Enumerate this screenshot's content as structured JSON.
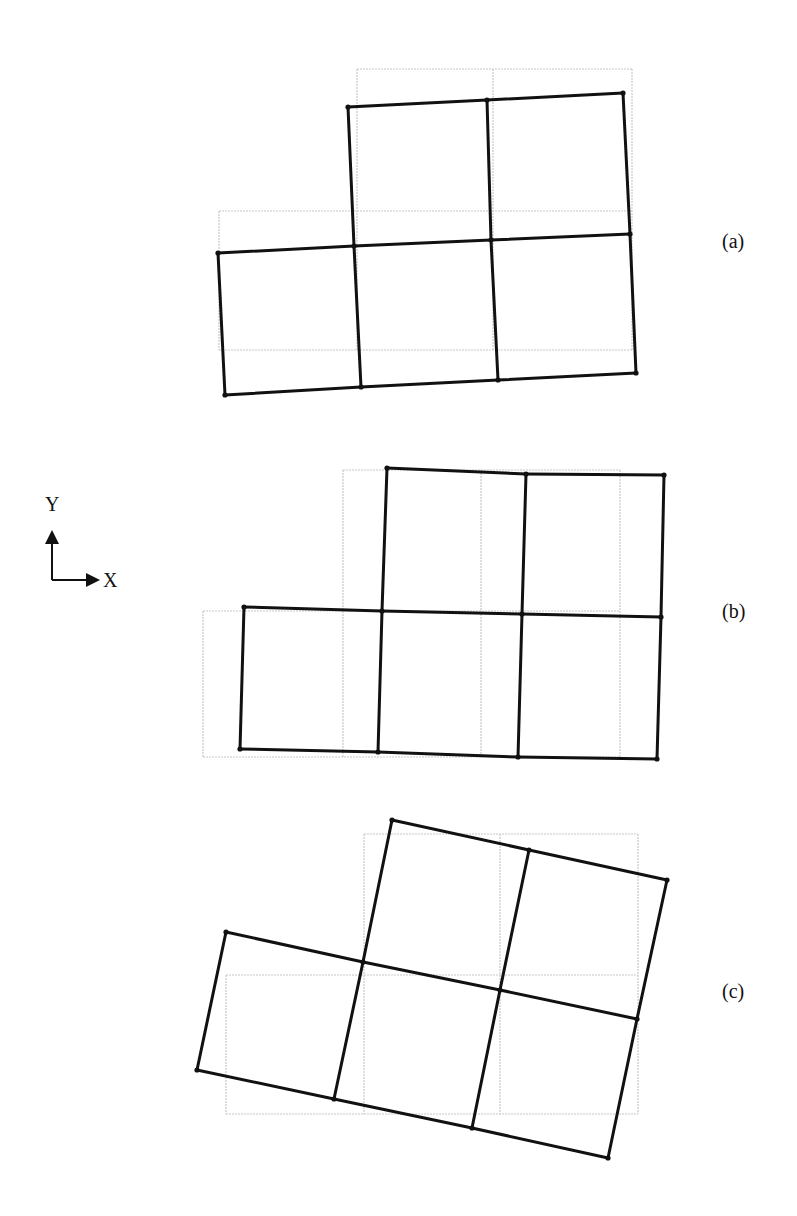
{
  "figure": {
    "axes_indicator": {
      "y_label": "Y",
      "x_label": "X",
      "origin": [
        52,
        580
      ],
      "y_tip": [
        52,
        532
      ],
      "x_tip": [
        98,
        580
      ]
    },
    "colors": {
      "reference_grid": "#c8c8c8",
      "deformed_mesh": "#111111",
      "background": "#ffffff"
    },
    "panels": [
      {
        "id": "a",
        "label": "(a)",
        "label_pos": [
          722,
          248
        ],
        "description": "L-shaped 5-element mesh with slight rotation (rigid-body rotation / shear)",
        "reference_grid": {
          "xs": [
            219,
            357,
            493,
            632
          ],
          "ys": [
            69,
            211,
            350
          ]
        },
        "deformed_nodes": {
          "top": [
            [
              348,
              107
            ],
            [
              487,
              100
            ],
            [
              623,
              93
            ]
          ],
          "middle": [
            [
              218,
              253
            ],
            [
              354,
              246
            ],
            [
              491,
              240
            ],
            [
              630,
              234
            ]
          ],
          "bottom": [
            [
              225,
              395
            ],
            [
              361,
              387
            ],
            [
              498,
              380
            ],
            [
              636,
              373
            ]
          ]
        }
      },
      {
        "id": "b",
        "label": "(b)",
        "label_pos": [
          722,
          618
        ],
        "description": "L-shaped mesh translated in +X with slight distortion",
        "reference_grid": {
          "xs": [
            203,
            343,
            481,
            620
          ],
          "ys": [
            470,
            611,
            757
          ]
        },
        "deformed_nodes": {
          "top": [
            [
              387,
              468
            ],
            [
              526,
              474
            ],
            [
              664,
              475
            ]
          ],
          "middle": [
            [
              244,
              607
            ],
            [
              382,
              611
            ],
            [
              522,
              614
            ],
            [
              661,
              617
            ]
          ],
          "bottom": [
            [
              240,
              749
            ],
            [
              378,
              752
            ],
            [
              518,
              757
            ],
            [
              657,
              759
            ]
          ]
        }
      },
      {
        "id": "c",
        "label": "(c)",
        "label_pos": [
          722,
          998
        ],
        "description": "L-shaped mesh rotated clockwise about its center",
        "reference_grid": {
          "xs": [
            226,
            364,
            500,
            638
          ],
          "ys": [
            834,
            975,
            1114
          ]
        },
        "deformed_nodes": {
          "top": [
            [
              392,
              820
            ],
            [
              529,
              850
            ],
            [
              667,
              880
            ]
          ],
          "middle": [
            [
              226,
              932
            ],
            [
              363,
              962
            ],
            [
              500,
              990
            ],
            [
              637,
              1019
            ]
          ],
          "bottom": [
            [
              197,
              1070
            ],
            [
              334,
              1099
            ],
            [
              472,
              1128
            ],
            [
              608,
              1158
            ]
          ]
        }
      }
    ]
  }
}
